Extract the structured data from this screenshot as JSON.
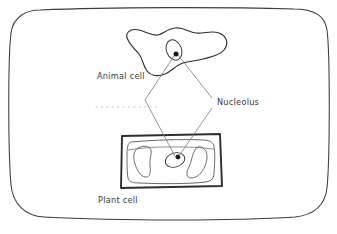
{
  "diagram": {
    "background_color": "#ffffff",
    "stroke_color": "#3c3c3c",
    "faint_stroke_color": "#b9b9b9",
    "nucleolus_fill": "#1a1a1a",
    "labels": [
      {
        "id": "animal-cell",
        "text": "Animal cell",
        "x": 97,
        "y": 79
      },
      {
        "id": "nucleolus",
        "text": "Nucleolus",
        "x": 217,
        "y": 105
      },
      {
        "id": "plant-cell",
        "text": "Plant cell",
        "x": 98,
        "y": 203
      }
    ],
    "parts": {
      "frame": "rounded-border",
      "animal_cell": "irregular-blob",
      "plant_cell": "rectangular-cell-wall",
      "nuclei": 2,
      "nucleoli": 2,
      "vacuoles": 2,
      "dotted_guide": "horizontal-dotted-line"
    }
  }
}
